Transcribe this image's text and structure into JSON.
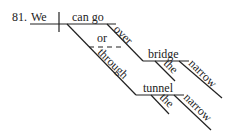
{
  "diagram": {
    "number": "81.",
    "subject": "We",
    "predicate": "can go",
    "conjunction": "or",
    "preposition_1": "over",
    "object_1": "bridge",
    "object_1_article": "the",
    "object_1_adjective": "narrow",
    "preposition_2": "through",
    "object_2": "tunnel",
    "object_2_article": "the",
    "object_2_adjective": "narrow"
  }
}
